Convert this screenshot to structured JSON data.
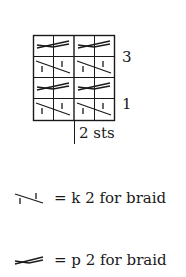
{
  "chart": {
    "columns": 4,
    "rows": 4,
    "cell_width": 20,
    "cell_height": 21,
    "row_labels": [
      {
        "row_index_from_top": 1,
        "label": "3"
      },
      {
        "row_index_from_top": 3,
        "label": "1"
      }
    ],
    "grid_rows_top_to_bottom": [
      {
        "braids": [
          "p2-braid",
          "p2-braid"
        ]
      },
      {
        "braids": [
          "k2-braid",
          "k2-braid"
        ]
      },
      {
        "braids": [
          "p2-braid",
          "p2-braid"
        ]
      },
      {
        "braids": [
          "k2-braid",
          "k2-braid"
        ]
      }
    ],
    "repeat_label": "2 sts"
  },
  "legend": [
    {
      "symbol": "k2-braid",
      "text": "= k 2 for braid"
    },
    {
      "symbol": "p2-braid",
      "text": "= p 2 for braid"
    }
  ],
  "colors": {
    "ink": "#1a1a1a",
    "background": "#ffffff"
  }
}
